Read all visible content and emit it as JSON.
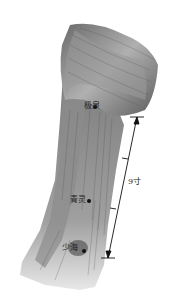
{
  "figure": {
    "points": [
      {
        "name": "极泉",
        "x": 95,
        "y": 107
      },
      {
        "name": "青灵",
        "x": 89,
        "y": 201
      },
      {
        "name": "少海",
        "x": 84,
        "y": 251
      }
    ],
    "measurement": {
      "label": "9寸",
      "top": {
        "x": 137,
        "y": 117
      },
      "bottom": {
        "x": 108,
        "y": 258
      }
    },
    "colors": {
      "background": "#ffffff",
      "muscle_dark": "#4a4a4a",
      "muscle_mid": "#8a8a8a",
      "muscle_light": "#c8c8c8",
      "line": "#111111"
    }
  }
}
